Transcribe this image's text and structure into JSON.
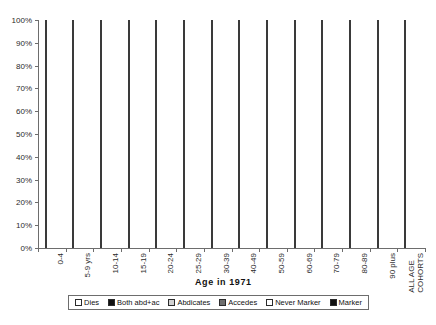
{
  "chart_data": {
    "type": "bar",
    "subtype": "stacked-100-percent",
    "title": "",
    "xlabel": "Age in 1971",
    "ylabel": "",
    "ylim": [
      0,
      100
    ],
    "ytick_labels": [
      "0%",
      "10%",
      "20%",
      "30%",
      "40%",
      "50%",
      "60%",
      "70%",
      "80%",
      "90%",
      "100%"
    ],
    "ytick_values": [
      0,
      10,
      20,
      30,
      40,
      50,
      60,
      70,
      80,
      90,
      100
    ],
    "grid": false,
    "legend_position": "bottom",
    "categories": [
      "0-4",
      "5-9 yrs",
      "10-14",
      "15-19",
      "20-24",
      "25-29",
      "30-39",
      "40-49",
      "50-59",
      "60-69",
      "70-79",
      "80-89",
      "90 plus",
      "ALL AGE\nCOHORTS"
    ],
    "series": [
      {
        "name": "Marker",
        "key": "marker",
        "color": "#111111",
        "values": [
          0,
          0,
          0,
          3,
          24,
          41,
          46,
          41,
          30,
          17,
          3,
          0,
          0,
          22
        ]
      },
      {
        "name": "Never Marker",
        "key": "nevermarker",
        "color": "#ffffff",
        "values": [
          0,
          0,
          1,
          0,
          0,
          0,
          0,
          0,
          0,
          4,
          0,
          0,
          0,
          0
        ]
      },
      {
        "name": "Accedes",
        "key": "accedes",
        "color": "#6e6e6e",
        "values": [
          0,
          0,
          0,
          0,
          0,
          0,
          0,
          0,
          0,
          12,
          0,
          0,
          0,
          0
        ]
      },
      {
        "name": "Abdicates",
        "key": "abdicates",
        "color": "#d2d2d2",
        "values": [
          68,
          48,
          39,
          37,
          17,
          14,
          16,
          31,
          48,
          0,
          0,
          0,
          0,
          30
        ]
      },
      {
        "name": "Both abd+ac",
        "key": "both",
        "color": "#111111",
        "values": [
          0,
          0,
          2,
          2,
          0,
          0,
          0,
          0,
          1,
          0,
          0,
          0,
          0,
          2
        ]
      },
      {
        "name": "Accedes2",
        "key": "accedes",
        "color": "#6e6e6e",
        "values": [
          30,
          50,
          51,
          50,
          50,
          36,
          20,
          11,
          15,
          0,
          0,
          0,
          0,
          21
        ]
      },
      {
        "name": "Dies",
        "key": "dies",
        "color": "#ffffff",
        "values": [
          2,
          2,
          7,
          8,
          9,
          9,
          18,
          17,
          6,
          67,
          97,
          100,
          100,
          25
        ]
      }
    ],
    "stacks": [
      {
        "category": "0-4",
        "segments": [
          {
            "key": "abdicates",
            "label": "Abdicates",
            "from": 0,
            "to": 68
          },
          {
            "key": "accedes",
            "label": "Accedes",
            "from": 68,
            "to": 98
          },
          {
            "key": "dies",
            "label": "Dies",
            "from": 98,
            "to": 100
          }
        ]
      },
      {
        "category": "5-9 yrs",
        "segments": [
          {
            "key": "abdicates",
            "label": "Abdicates",
            "from": 0,
            "to": 48
          },
          {
            "key": "accedes",
            "label": "Accedes",
            "from": 48,
            "to": 98
          },
          {
            "key": "dies",
            "label": "Dies",
            "from": 98,
            "to": 100
          }
        ]
      },
      {
        "category": "10-14",
        "segments": [
          {
            "key": "abdicates",
            "label": "Abdicates",
            "from": 0,
            "to": 40
          },
          {
            "key": "both",
            "label": "Both abd+ac",
            "from": 40,
            "to": 42
          },
          {
            "key": "accedes",
            "label": "Accedes",
            "from": 42,
            "to": 93
          },
          {
            "key": "dies",
            "label": "Dies",
            "from": 93,
            "to": 100
          }
        ]
      },
      {
        "category": "15-19",
        "segments": [
          {
            "key": "marker",
            "label": "Marker",
            "from": 0,
            "to": 3
          },
          {
            "key": "abdicates",
            "label": "Abdicates",
            "from": 3,
            "to": 40
          },
          {
            "key": "both",
            "label": "Both abd+ac",
            "from": 40,
            "to": 42
          },
          {
            "key": "accedes",
            "label": "Accedes",
            "from": 42,
            "to": 92
          },
          {
            "key": "dies",
            "label": "Dies",
            "from": 92,
            "to": 100
          }
        ]
      },
      {
        "category": "20-24",
        "segments": [
          {
            "key": "marker",
            "label": "Marker",
            "from": 0,
            "to": 24
          },
          {
            "key": "accedes",
            "label": "Accedes",
            "from": 24,
            "to": 74
          },
          {
            "key": "abdicates",
            "label": "Abdicates",
            "from": 74,
            "to": 91
          },
          {
            "key": "both",
            "label": "Both abd+ac",
            "from": 91,
            "to": 96
          },
          {
            "key": "dies",
            "label": "Dies",
            "from": 96,
            "to": 100
          }
        ]
      },
      {
        "category": "25-29",
        "segments": [
          {
            "key": "marker",
            "label": "Marker",
            "from": 0,
            "to": 41
          },
          {
            "key": "accedes",
            "label": "Accedes",
            "from": 41,
            "to": 77
          },
          {
            "key": "abdicates",
            "label": "Abdicates",
            "from": 77,
            "to": 86
          },
          {
            "key": "both",
            "label": "Both abd+ac",
            "from": 86,
            "to": 92
          },
          {
            "key": "dies",
            "label": "Dies",
            "from": 92,
            "to": 100
          }
        ]
      },
      {
        "category": "30-39",
        "segments": [
          {
            "key": "marker",
            "label": "Marker",
            "from": 0,
            "to": 46
          },
          {
            "key": "accedes",
            "label": "Accedes",
            "from": 46,
            "to": 66
          },
          {
            "key": "abdicates",
            "label": "Abdicates",
            "from": 66,
            "to": 82
          },
          {
            "key": "both",
            "label": "Both abd+ac",
            "from": 82,
            "to": 85
          },
          {
            "key": "dies",
            "label": "Dies",
            "from": 85,
            "to": 100
          }
        ]
      },
      {
        "category": "40-49",
        "segments": [
          {
            "key": "marker",
            "label": "Marker",
            "from": 0,
            "to": 41
          },
          {
            "key": "abdicates",
            "label": "Abdicates",
            "from": 41,
            "to": 72
          },
          {
            "key": "accedes",
            "label": "Accedes",
            "from": 72,
            "to": 83
          },
          {
            "key": "both",
            "label": "Both abd+ac",
            "from": 83,
            "to": 86
          },
          {
            "key": "dies",
            "label": "Dies",
            "from": 86,
            "to": 100
          }
        ]
      },
      {
        "category": "50-59",
        "segments": [
          {
            "key": "marker",
            "label": "Marker",
            "from": 0,
            "to": 30
          },
          {
            "key": "abdicates",
            "label": "Abdicates",
            "from": 30,
            "to": 78
          },
          {
            "key": "accedes",
            "label": "Accedes",
            "from": 78,
            "to": 93
          },
          {
            "key": "both",
            "label": "Both abd+ac",
            "from": 93,
            "to": 94
          },
          {
            "key": "dies",
            "label": "Dies",
            "from": 94,
            "to": 100
          }
        ]
      },
      {
        "category": "60-69",
        "segments": [
          {
            "key": "marker",
            "label": "Marker",
            "from": 0,
            "to": 17
          },
          {
            "key": "nevermarker",
            "label": "Never Marker",
            "from": 17,
            "to": 21
          },
          {
            "key": "accedes",
            "label": "Accedes",
            "from": 21,
            "to": 33
          },
          {
            "key": "both",
            "label": "Both abd+ac",
            "from": 33,
            "to": 34
          },
          {
            "key": "dies",
            "label": "Dies",
            "from": 34,
            "to": 100
          }
        ]
      },
      {
        "category": "70-79",
        "segments": [
          {
            "key": "marker",
            "label": "Marker",
            "from": 0,
            "to": 3
          },
          {
            "key": "dies",
            "label": "Dies",
            "from": 3,
            "to": 100
          }
        ]
      },
      {
        "category": "80-89",
        "segments": [
          {
            "key": "dies",
            "label": "Dies",
            "from": 0,
            "to": 100
          }
        ]
      },
      {
        "category": "90 plus",
        "segments": [
          {
            "key": "dies",
            "label": "Dies",
            "from": 0,
            "to": 100
          }
        ]
      },
      {
        "category": "ALL AGE COHORTS",
        "segments": [
          {
            "key": "marker",
            "label": "Marker",
            "from": 0,
            "to": 22
          },
          {
            "key": "abdicates",
            "label": "Abdicates",
            "from": 22,
            "to": 52
          },
          {
            "key": "accedes",
            "label": "Accedes",
            "from": 52,
            "to": 73
          },
          {
            "key": "both",
            "label": "Both abd+ac",
            "from": 73,
            "to": 75
          },
          {
            "key": "dies",
            "label": "Dies",
            "from": 75,
            "to": 100
          }
        ]
      }
    ],
    "legend": [
      {
        "label": "Dies",
        "key": "dies",
        "color": "#ffffff"
      },
      {
        "label": "Both abd+ac",
        "key": "both",
        "color": "#111111"
      },
      {
        "label": "Abdicates",
        "key": "abdicates",
        "color": "#d2d2d2"
      },
      {
        "label": "Accedes",
        "key": "accedes",
        "color": "#6e6e6e"
      },
      {
        "label": "Never Marker",
        "key": "nevermarker",
        "color": "#ffffff"
      },
      {
        "label": "Marker",
        "key": "marker",
        "color": "#111111"
      }
    ]
  }
}
